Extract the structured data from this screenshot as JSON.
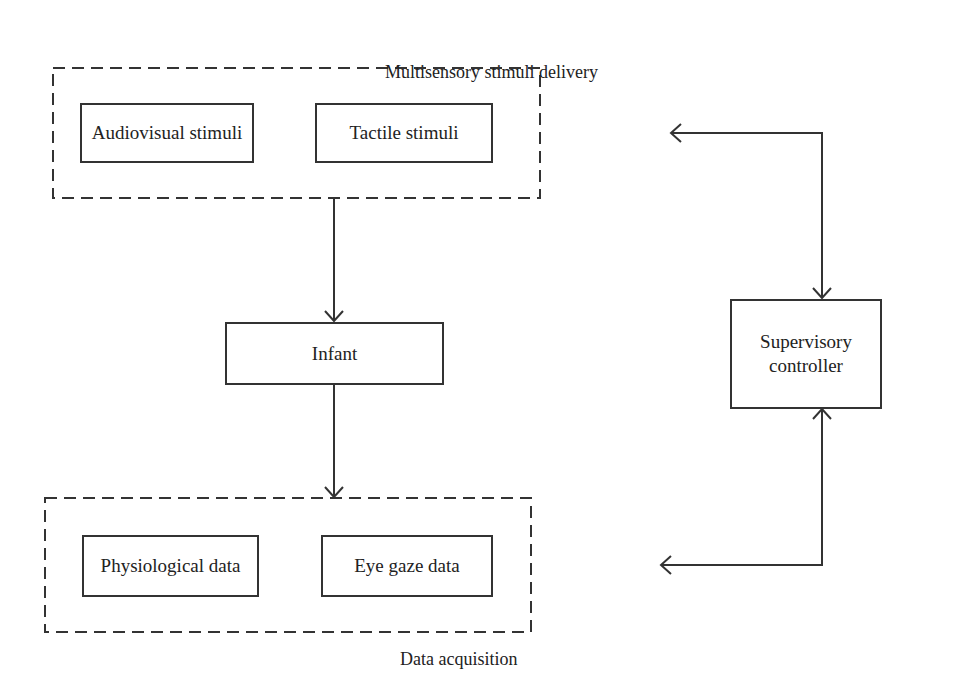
{
  "diagram": {
    "groups": [
      {
        "id": "stimuli-delivery",
        "label": "Multisensory stimuli delivery",
        "blocks": [
          {
            "label": "Audiovisual stimuli"
          },
          {
            "label": "Tactile stimuli"
          }
        ]
      },
      {
        "id": "data-acquisition",
        "label": "Data acquisition",
        "blocks": [
          {
            "label": "Physiological data"
          },
          {
            "label": "Eye gaze data"
          }
        ]
      }
    ],
    "nodes": {
      "infant": {
        "label": "Infant"
      },
      "controller": {
        "label": "Supervisory controller",
        "line1": "Supervisory",
        "line2": "controller"
      }
    },
    "edges": [
      {
        "from": "Multisensory stimuli delivery",
        "to": "Infant",
        "direction": "one-way"
      },
      {
        "from": "Infant",
        "to": "Data acquisition",
        "direction": "one-way"
      },
      {
        "from": "Supervisory controller",
        "to": "Multisensory stimuli delivery",
        "direction": "two-way"
      },
      {
        "from": "Supervisory controller",
        "to": "Data acquisition",
        "direction": "two-way"
      }
    ],
    "colors": {
      "line": "#333333",
      "background": "#ffffff"
    }
  }
}
